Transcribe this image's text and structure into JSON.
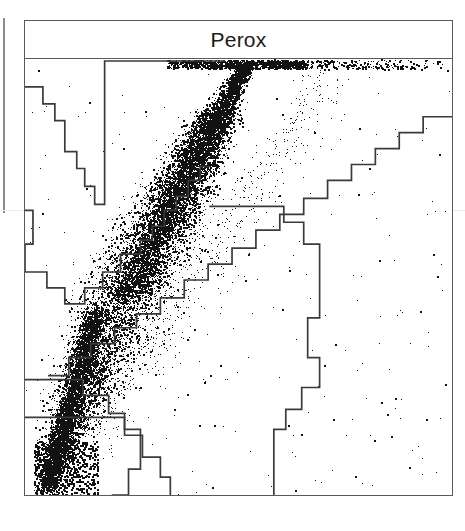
{
  "figure": {
    "kind": "flow-cytometry-dot-plot",
    "title": "Perox",
    "background_color": "#ffffff",
    "frame_color": "#5a5a5a",
    "dot_color": "#121212",
    "gate_color": "#3a3a3a",
    "edge_rule_color": "#8c8c8c",
    "faint_rule_color": "#eceaea"
  },
  "header": {
    "title": "Perox"
  },
  "panel": {
    "title_strip": {
      "x": 24,
      "y": 20,
      "width": 429,
      "height": 39
    },
    "plot_area": {
      "x": 24,
      "y": 58,
      "width": 429,
      "height": 438
    }
  },
  "decorations": {
    "edge_rule": {
      "x": 3,
      "y": 18,
      "width": 2,
      "height": 195
    },
    "faint_rule": {
      "x": 0,
      "y": 210,
      "width": 465
    }
  },
  "chart_data": {
    "type": "scatter",
    "title": "Perox",
    "xlabel": "",
    "ylabel": "",
    "xlim": [
      0,
      1
    ],
    "ylim": [
      0,
      1
    ],
    "grid": false,
    "legend": "none",
    "axis_tick_labels": {
      "x": [],
      "y": []
    },
    "annotations": [],
    "populations": [
      {
        "name": "main-diagonal-population",
        "shape": "elongated-diagonal-cloud",
        "density": "very-high",
        "x_range": [
          0.04,
          0.58
        ],
        "y_range": [
          0.02,
          0.99
        ],
        "n_points": 9000
      },
      {
        "name": "top-saturated-band",
        "shape": "horizontal-band-clipped-at-axis",
        "density": "high",
        "x_range": [
          0.33,
          0.98
        ],
        "y_range": [
          0.975,
          1.0
        ],
        "n_points": 900
      },
      {
        "name": "low-signal-corner-cluster",
        "shape": "rectangular-lattice",
        "density": "medium",
        "x_range": [
          0.02,
          0.17
        ],
        "y_range": [
          0.0,
          0.13
        ],
        "n_points": 700
      },
      {
        "name": "sparse-background",
        "shape": "scattered",
        "density": "very-low",
        "x_range": [
          0.0,
          1.0
        ],
        "y_range": [
          0.0,
          1.0
        ],
        "n_points": 260
      }
    ],
    "gates": [
      {
        "name": "upper-left-gate",
        "style": "stepped-polyline",
        "points_px": [
          [
            0,
            28
          ],
          [
            18,
            28
          ],
          [
            18,
            45
          ],
          [
            30,
            45
          ],
          [
            30,
            62
          ],
          [
            40,
            62
          ],
          [
            40,
            93
          ],
          [
            52,
            93
          ],
          [
            52,
            110
          ],
          [
            60,
            110
          ],
          [
            60,
            128
          ],
          [
            70,
            128
          ],
          [
            70,
            146
          ],
          [
            80,
            146
          ],
          [
            80,
            2
          ],
          [
            200,
            2
          ]
        ]
      },
      {
        "name": "left-lower-gate",
        "style": "stepped-polyline",
        "points_px": [
          [
            0,
            152
          ],
          [
            8,
            152
          ],
          [
            8,
            186
          ],
          [
            0,
            186
          ],
          [
            0,
            214
          ],
          [
            22,
            214
          ],
          [
            22,
            230
          ],
          [
            40,
            230
          ],
          [
            40,
            246
          ],
          [
            60,
            246
          ],
          [
            60,
            230
          ],
          [
            78,
            230
          ],
          [
            78,
            214
          ],
          [
            96,
            214
          ],
          [
            96,
            196
          ],
          [
            116,
            196
          ],
          [
            116,
            182
          ],
          [
            128,
            182
          ],
          [
            128,
            168
          ],
          [
            140,
            168
          ],
          [
            140,
            152
          ],
          [
            152,
            152
          ],
          [
            152,
            138
          ],
          [
            164,
            138
          ],
          [
            164,
            122
          ],
          [
            176,
            122
          ],
          [
            176,
            108
          ],
          [
            186,
            108
          ]
        ]
      },
      {
        "name": "central-vertical-gate",
        "style": "stepped-polyline",
        "points_px": [
          [
            0,
            322
          ],
          [
            58,
            322
          ],
          [
            58,
            338
          ],
          [
            84,
            338
          ],
          [
            84,
            356
          ],
          [
            100,
            356
          ],
          [
            100,
            372
          ],
          [
            116,
            372
          ],
          [
            116,
            412
          ],
          [
            104,
            412
          ],
          [
            104,
            438
          ],
          [
            88,
            438
          ],
          [
            88,
            454
          ],
          [
            66,
            454
          ],
          [
            66,
            470
          ],
          [
            56,
            470
          ],
          [
            56,
            438
          ]
        ]
      },
      {
        "name": "bottom-left-gate",
        "style": "stepped-polyline",
        "points_px": [
          [
            0,
            360
          ],
          [
            100,
            360
          ],
          [
            100,
            378
          ],
          [
            118,
            378
          ],
          [
            118,
            400
          ],
          [
            136,
            400
          ],
          [
            136,
            420
          ],
          [
            146,
            420
          ],
          [
            146,
            438
          ]
        ]
      },
      {
        "name": "right-diagonal-gate",
        "style": "stepped-staircase",
        "points_px": [
          [
            24,
            318
          ],
          [
            44,
            318
          ],
          [
            44,
            300
          ],
          [
            66,
            300
          ],
          [
            66,
            286
          ],
          [
            90,
            286
          ],
          [
            90,
            270
          ],
          [
            112,
            270
          ],
          [
            112,
            256
          ],
          [
            136,
            256
          ],
          [
            136,
            240
          ],
          [
            160,
            240
          ],
          [
            160,
            222
          ],
          [
            184,
            222
          ],
          [
            184,
            206
          ],
          [
            208,
            206
          ],
          [
            208,
            190
          ],
          [
            232,
            190
          ],
          [
            232,
            172
          ],
          [
            256,
            172
          ],
          [
            256,
            156
          ],
          [
            280,
            156
          ],
          [
            280,
            140
          ],
          [
            304,
            140
          ],
          [
            304,
            122
          ],
          [
            328,
            122
          ],
          [
            328,
            106
          ],
          [
            352,
            106
          ],
          [
            352,
            90
          ],
          [
            376,
            90
          ],
          [
            376,
            74
          ],
          [
            400,
            74
          ],
          [
            400,
            58
          ],
          [
            429,
            58
          ]
        ]
      },
      {
        "name": "lower-right-gate",
        "style": "stepped-polyline",
        "points_px": [
          [
            186,
            148
          ],
          [
            260,
            148
          ],
          [
            260,
            164
          ],
          [
            280,
            164
          ],
          [
            280,
            186
          ],
          [
            296,
            186
          ],
          [
            296,
            260
          ],
          [
            284,
            260
          ],
          [
            284,
            300
          ],
          [
            296,
            300
          ],
          [
            296,
            330
          ],
          [
            278,
            330
          ],
          [
            278,
            352
          ],
          [
            262,
            352
          ],
          [
            262,
            372
          ],
          [
            250,
            372
          ],
          [
            250,
            438
          ]
        ]
      }
    ]
  }
}
